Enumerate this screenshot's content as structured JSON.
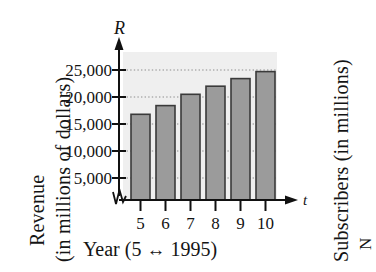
{
  "figure": {
    "kind": "textbook-bar-chart",
    "axis_letters": {
      "y": "R",
      "x": "t"
    },
    "y_axis_title_line1": "Revenue",
    "y_axis_title_line2": "(in millions of dollars)",
    "x_axis_caption_prefix": "Year (5 ",
    "x_axis_caption_arrow": "↔",
    "x_axis_caption_suffix": " 1995)",
    "x_axis_caption_full": "Year (5 ↔ 1995)",
    "adjacent_figure_label": "Subscribers (in millions)",
    "adjacent_figure_label_partial": "N",
    "has_axis_break": true,
    "colors": {
      "panel_background": "#efefef",
      "bar_fill": "#9b9b9b",
      "bar_border": "#3a3a3a",
      "axis": "#111111",
      "gridline": "#8d8d8d",
      "text": "#141414",
      "page_background": "#ffffff"
    }
  },
  "chart_data": {
    "type": "bar",
    "title": "",
    "subtitle": "",
    "xlabel": "Year (5 ↔ 1995)",
    "ylabel": "Revenue (in millions of dollars)",
    "categories": [
      "5",
      "6",
      "7",
      "8",
      "9",
      "10"
    ],
    "values": [
      16800,
      18400,
      20500,
      22000,
      23400,
      24700
    ],
    "ylim": [
      0,
      27000
    ],
    "ytick_values": [
      5000,
      10000,
      15000,
      20000,
      25000
    ],
    "ytick_labels": [
      "5,000",
      "10,000",
      "15,000",
      "20,000",
      "25,000"
    ],
    "xtick_labels": [
      "5",
      "6",
      "7",
      "8",
      "9",
      "10"
    ],
    "grid": true,
    "grid_style": "dotted-horizontal",
    "legend": "none",
    "axis_arrows": true
  }
}
